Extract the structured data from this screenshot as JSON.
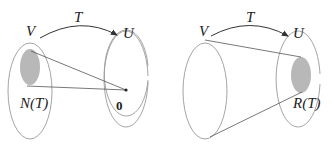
{
  "diagrams": [
    {
      "id": "kernel",
      "domain_label": "V",
      "codomain_label": "U",
      "map_label": "T",
      "subset_label": "N(T)",
      "point_label": "0"
    },
    {
      "id": "range",
      "domain_label": "V",
      "codomain_label": "U",
      "map_label": "T",
      "subset_label": "R(T)"
    }
  ],
  "colors": {
    "outline": "#9a9a9a",
    "shaded": "#b8b8b8",
    "line": "#555555",
    "text": "#222222"
  }
}
